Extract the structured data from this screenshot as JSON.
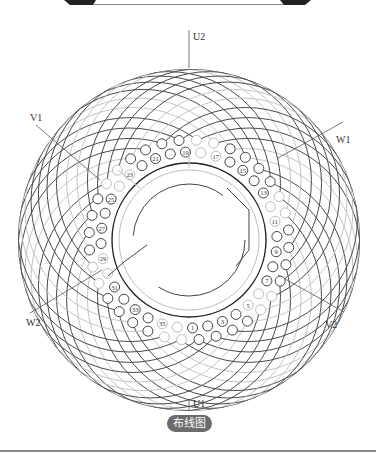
{
  "diagram": {
    "title": "布线图",
    "phase_labels": {
      "U1": "U1",
      "U2": "U2",
      "V1": "V1",
      "V2": "V2",
      "W1": "W1",
      "W2": "W2"
    },
    "slot_count": 36,
    "slot_numbers_labeled": [
      "1",
      "3",
      "5",
      "7",
      "9",
      "11",
      "13",
      "15",
      "17",
      "19",
      "21",
      "23",
      "25",
      "27",
      "29",
      "31",
      "33",
      "35"
    ],
    "colors": {
      "dark_line": "#333333",
      "light_line": "#bdbdbd",
      "pill_bg": "#6b6b6b",
      "pill_text": "#ffffff"
    }
  }
}
